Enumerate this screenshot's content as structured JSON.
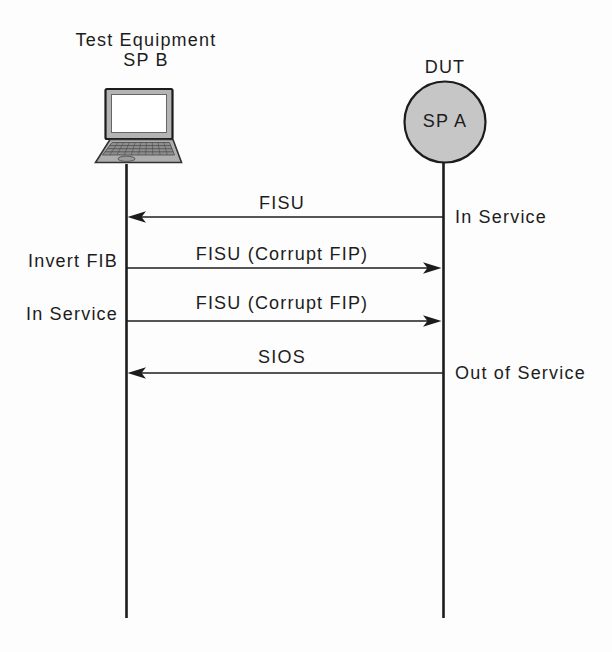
{
  "diagram": {
    "left_actor": {
      "title_line1": "Test Equipment",
      "title_line2": "SP B",
      "icon": "laptop-icon"
    },
    "right_actor": {
      "title": "DUT",
      "node_label": "SP A",
      "icon": "circle-node"
    },
    "messages": [
      {
        "label": "FISU",
        "direction": "right-to-left",
        "right_note": "In Service"
      },
      {
        "label": "FISU (Corrupt FIP)",
        "direction": "left-to-right",
        "left_note": "Invert FIB"
      },
      {
        "label": "FISU (Corrupt FIP)",
        "direction": "left-to-right",
        "left_note": "In Service"
      },
      {
        "label": "SIOS",
        "direction": "right-to-left",
        "right_note": "Out of Service"
      }
    ],
    "colors": {
      "line": "#1c1c1c",
      "node_fill": "#c6c6c6",
      "laptop_bezel": "#b4b4b4",
      "laptop_base": "#aeaeae",
      "keyboard": "#8f8f8f",
      "screen": "#ffffff",
      "background": "#fdfdfd"
    }
  }
}
